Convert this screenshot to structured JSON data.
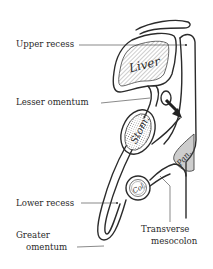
{
  "diagram": {
    "type": "anatomical cross-section",
    "labels": {
      "upper_recess": "Upper recess",
      "lesser_omentum": "Lesser omentum",
      "lower_recess": "Lower recess",
      "greater_omentum_line1": "Greater",
      "greater_omentum_line2": "omentum",
      "transverse_mesocolon_line1": "Transverse",
      "transverse_mesocolon_line2": "mesocolon"
    },
    "organs": {
      "liver": "Liver",
      "stomach": "Stom.",
      "colon": "Col.",
      "pancreas": "Pan."
    },
    "colors": {
      "line": "#2b2b2b",
      "text": "#2a2a2a",
      "background": "#ffffff"
    }
  }
}
